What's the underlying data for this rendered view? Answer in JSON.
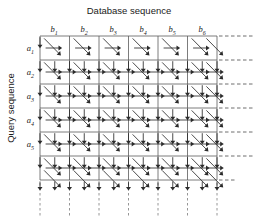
{
  "figure": {
    "title_top": "Database sequence",
    "title_left": "Query sequence",
    "column_labels": [
      "b_1",
      "b_2",
      "b_3",
      "b_4",
      "b_5",
      "b_6"
    ],
    "column_label_bases": [
      "b",
      "b",
      "b",
      "b",
      "b",
      "b"
    ],
    "column_label_subs": [
      "1",
      "2",
      "3",
      "4",
      "5",
      "6"
    ],
    "row_labels": [
      "a_1",
      "a_2",
      "a_3",
      "a_4",
      "a_5"
    ],
    "row_label_bases": [
      "a",
      "a",
      "a",
      "a",
      "a"
    ],
    "row_label_subs": [
      "1",
      "2",
      "3",
      "4",
      "5"
    ]
  },
  "chart_data": {
    "type": "diagram",
    "title": "Database sequence",
    "xlabel": "Database sequence",
    "ylabel": "Query sequence",
    "categories_x": [
      "b_1",
      "b_2",
      "b_3",
      "b_4",
      "b_5",
      "b_6"
    ],
    "categories_y": [
      "a_1",
      "a_2",
      "a_3",
      "a_4",
      "a_5"
    ],
    "grid": true,
    "legend": "none",
    "grid_geometry": {
      "x_left": 40,
      "x_right": 217,
      "y_top": 36,
      "y_bottom": 180,
      "n_cols": 6,
      "n_rows": 6,
      "col_width": 29.5,
      "row_height": 24,
      "node_cols": 12,
      "node_rows": 12
    },
    "arrow_types": [
      "horizontal-right",
      "vertical-down",
      "diagonal-down-right"
    ],
    "extension_right_label": "dashed continuation",
    "extension_bottom_label": "dashed continuation"
  }
}
